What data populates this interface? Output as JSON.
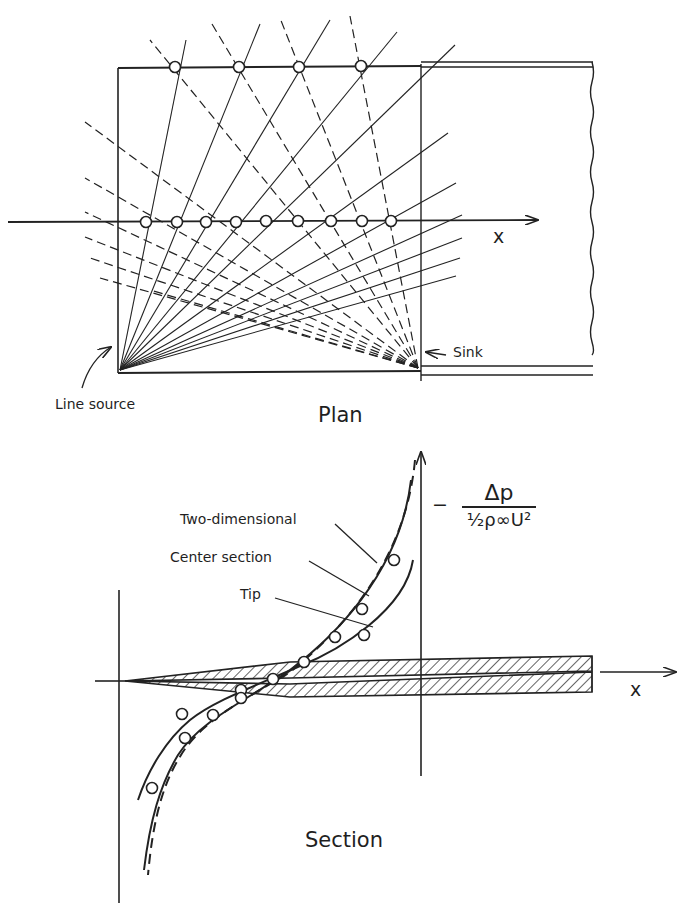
{
  "plan": {
    "title": "Plan",
    "axis_label": "x",
    "source_label": "Line source",
    "sink_label": "Sink",
    "top_edge_points_x": [
      175,
      239,
      299,
      361
    ],
    "axis_points_x": [
      146,
      177,
      206,
      236,
      266,
      298,
      331,
      362,
      391
    ]
  },
  "section": {
    "title": "Section",
    "axis_label": "x",
    "y_label_minus": "−",
    "y_label_numerator": "Δp",
    "y_label_denominator": "½ρ∞U²",
    "curves": [
      {
        "name": "Two-dimensional",
        "style": "dashed"
      },
      {
        "name": "Center section",
        "style": "solid"
      },
      {
        "name": "Tip",
        "style": "solid"
      }
    ]
  },
  "colors": {
    "ink": "#1f1f1f",
    "paper": "#ffffff"
  }
}
